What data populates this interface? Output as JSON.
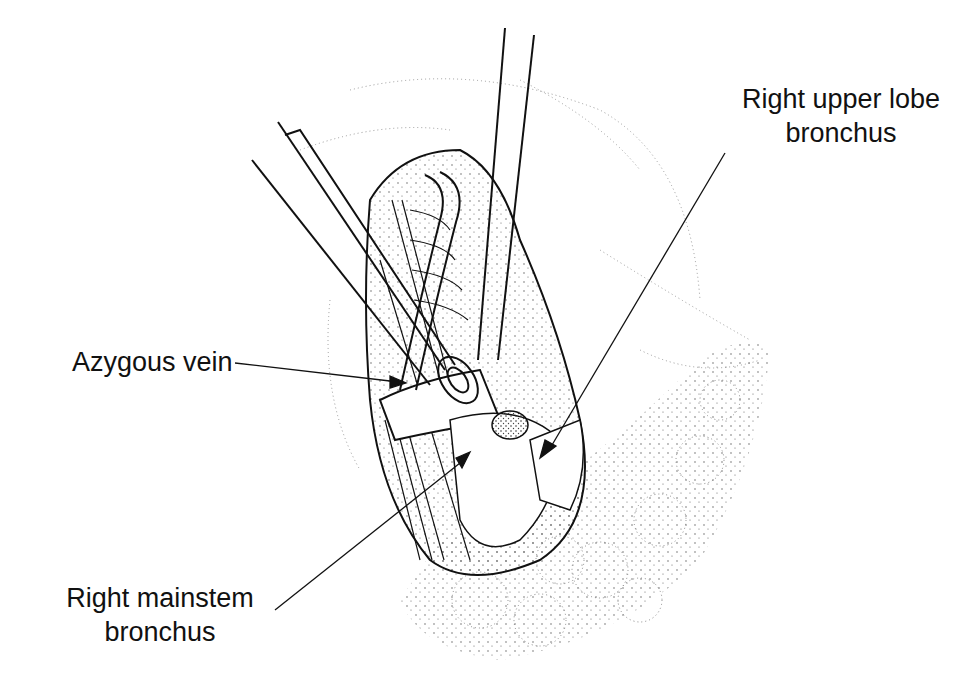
{
  "figure": {
    "type": "surgical illustration",
    "colors": {
      "ink": "#111111",
      "background": "#ffffff",
      "stipple": "#555555"
    },
    "labels": [
      {
        "id": "right-upper-lobe-bronchus",
        "lines": [
          "Right upper lobe",
          "bronchus"
        ]
      },
      {
        "id": "azygous-vein",
        "lines": [
          "Azygous vein"
        ]
      },
      {
        "id": "right-mainstem-bronchus",
        "lines": [
          "Right mainstem",
          "bronchus"
        ]
      }
    ]
  }
}
